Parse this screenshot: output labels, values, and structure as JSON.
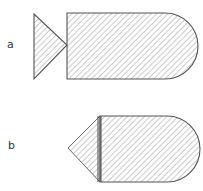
{
  "figures": [
    {
      "label": "a",
      "description": "triangle apex touching flat face of rounded-end body",
      "triangle": {
        "points": [
          [
            34,
            14
          ],
          [
            67,
            45
          ],
          [
            34,
            79
          ]
        ]
      },
      "body": {
        "x": 67,
        "y": 13,
        "width": 98,
        "height": 66,
        "rounded_right_radius": 33
      }
    },
    {
      "label": "b",
      "description": "cone tip joined to rounded-end body with double seam line",
      "triangle": {
        "points": [
          [
            100,
            116
          ],
          [
            68,
            148
          ],
          [
            100,
            182
          ]
        ]
      },
      "body": {
        "x": 100,
        "y": 116,
        "width": 67,
        "height": 66,
        "rounded_right_radius": 33
      }
    }
  ],
  "colors": {
    "outline": "#555555",
    "hatch": "#999999",
    "background": "#ffffff"
  }
}
